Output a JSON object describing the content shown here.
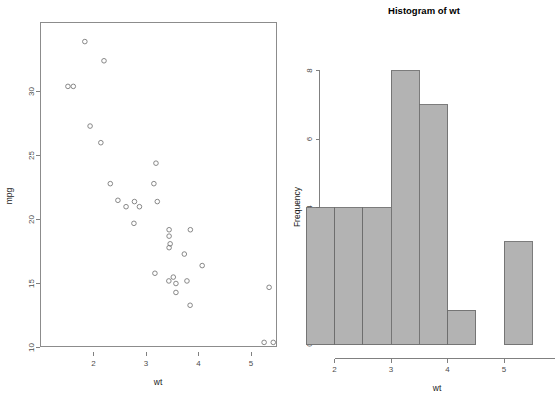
{
  "figure": {
    "background": "#ffffff",
    "panel_count": 2
  },
  "chart_data": [
    {
      "type": "scatter",
      "id": "scatter-wt-mpg",
      "title": "",
      "xlabel": "wt",
      "ylabel": "mpg",
      "xlim": [
        1.3,
        5.6
      ],
      "ylim": [
        9.4,
        34.6
      ],
      "xticks": [
        2,
        3,
        4,
        5
      ],
      "xtick_labels": [
        "2",
        "3",
        "4",
        "5"
      ],
      "yticks": [
        10,
        15,
        20,
        25,
        30
      ],
      "ytick_labels": [
        "10",
        "15",
        "20",
        "25",
        "30"
      ],
      "grid": false,
      "legend": false,
      "marker": "open-circle",
      "marker_color": "#7a7a7a",
      "frame": true,
      "x": [
        2.62,
        2.875,
        2.32,
        3.215,
        3.44,
        3.46,
        3.57,
        3.19,
        3.15,
        3.44,
        3.44,
        4.07,
        3.73,
        3.78,
        5.25,
        5.424,
        5.345,
        2.2,
        1.615,
        1.835,
        2.465,
        3.52,
        3.435,
        3.84,
        3.845,
        1.935,
        2.14,
        1.513,
        3.17,
        2.77,
        3.57,
        2.78
      ],
      "y": [
        21.0,
        21.0,
        22.8,
        21.4,
        18.7,
        18.1,
        14.3,
        24.4,
        22.8,
        19.2,
        17.8,
        16.4,
        17.3,
        15.2,
        10.4,
        10.4,
        14.7,
        32.4,
        30.4,
        33.9,
        21.5,
        15.5,
        15.2,
        13.3,
        19.2,
        27.3,
        26.0,
        30.4,
        15.8,
        19.7,
        15.0,
        21.4
      ]
    },
    {
      "type": "bar",
      "subtype": "histogram",
      "id": "histogram-wt",
      "title": "Histogram of wt",
      "xlabel": "wt",
      "ylabel": "Frequency",
      "xlim": [
        1.5,
        5.5
      ],
      "ylim": [
        0,
        8
      ],
      "xticks": [
        2,
        3,
        4,
        5
      ],
      "xtick_labels": [
        "2",
        "3",
        "4",
        "5"
      ],
      "yticks": [
        0,
        2,
        4,
        6,
        8
      ],
      "ytick_labels": [
        "0",
        "2",
        "4",
        "6",
        "8"
      ],
      "grid": false,
      "legend": false,
      "bin_width": 0.5,
      "bin_edges": [
        1.5,
        2.0,
        2.5,
        3.0,
        3.5,
        4.0,
        4.5,
        5.0,
        5.5
      ],
      "categories": [
        "1.5-2.0",
        "2.0-2.5",
        "2.5-3.0",
        "3.0-3.5",
        "3.5-4.0",
        "4.0-4.5",
        "4.5-5.0",
        "5.0-5.5"
      ],
      "values": [
        4,
        4,
        4,
        8,
        7,
        1,
        0,
        3
      ],
      "bar_fill": "#b3b3b3",
      "bar_border": "#6e6e6e"
    }
  ]
}
